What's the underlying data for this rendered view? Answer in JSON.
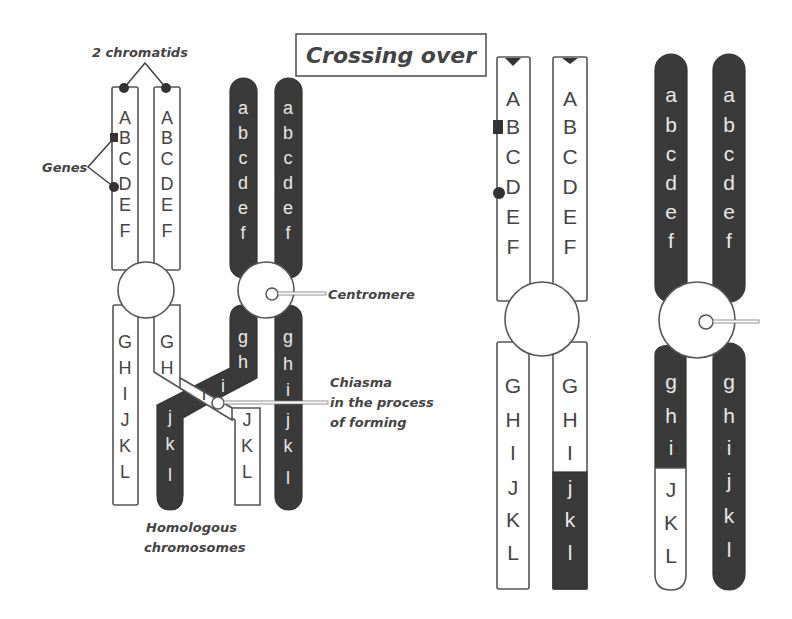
{
  "title": "Crossing over",
  "labels": {
    "chromatids": "2 chromatids",
    "genes": "Genes",
    "centromere": "Centromere",
    "chiasma_line1": "Chiasma",
    "chiasma_line2": "in the process",
    "chiasma_line3": "of forming",
    "homologous_line1": "Homologous",
    "homologous_line2": "chromosomes"
  },
  "genes": {
    "upper_cap": [
      "A",
      "B",
      "C",
      "D",
      "E",
      "F"
    ],
    "upper_low": [
      "a",
      "b",
      "c",
      "d",
      "e",
      "f"
    ],
    "lower_cap": [
      "G",
      "H",
      "I",
      "J",
      "K",
      "L"
    ],
    "lower_low": [
      "g",
      "h",
      "i",
      "j",
      "k",
      "l"
    ]
  },
  "colors": {
    "dark_chromatid": "#3a3a3a",
    "outline": "#555555",
    "background": "#ffffff"
  }
}
